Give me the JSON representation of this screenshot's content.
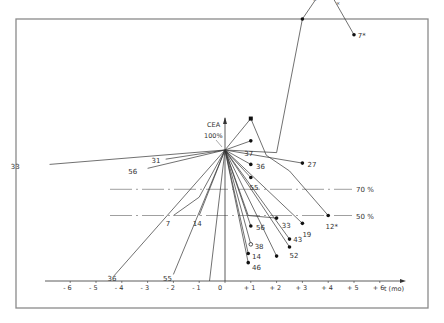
{
  "chart_data": {
    "type": "line",
    "title": "",
    "xlabel": "t (mo)",
    "ylabel": "CEA",
    "reference_label": "100%",
    "xlim": [
      -6.5,
      6.5
    ],
    "ylim": [
      0,
      240
    ],
    "x_ticks": [
      "- 6",
      "- 5",
      "- 4",
      "- 3",
      "- 2",
      "- 1",
      "0",
      "+ 1",
      "+ 2",
      "+ 3",
      "+ 4",
      "+ 5",
      "+ 6"
    ],
    "x_tick_values": [
      -6,
      -5,
      -4,
      -3,
      -2,
      -1,
      0,
      1,
      2,
      3,
      4,
      5,
      6
    ],
    "threshold_lines": [
      {
        "label": "70 %",
        "value": 70
      },
      {
        "label": "50 %",
        "value": 50
      }
    ],
    "peak_annotation": {
      "label": "226 %",
      "x": 3.9,
      "y": 226
    },
    "grid": false,
    "series": [
      {
        "name": "7*",
        "points": [
          [
            0,
            100
          ],
          [
            2.0,
            98
          ],
          [
            3.0,
            200
          ],
          [
            3.9,
            226
          ],
          [
            5.0,
            188
          ]
        ],
        "marker": true,
        "label_end": "7*"
      },
      {
        "name": "unlabeled-peak",
        "points": [
          [
            0,
            100
          ],
          [
            1.0,
            124
          ],
          [
            1.6,
            96
          ],
          [
            2.5,
            84
          ],
          [
            4.0,
            50
          ]
        ],
        "marker": true,
        "label_end": "12*"
      },
      {
        "name": "37",
        "points": [
          [
            0,
            100
          ],
          [
            1.0,
            107
          ]
        ],
        "marker": true
      },
      {
        "name": "27",
        "points": [
          [
            0,
            100
          ],
          [
            3.0,
            90
          ]
        ],
        "marker": true
      },
      {
        "name": "36a",
        "points": [
          [
            0,
            100
          ],
          [
            1.0,
            89
          ]
        ],
        "marker": true
      },
      {
        "name": "55a",
        "points": [
          [
            0,
            100
          ],
          [
            1.0,
            79
          ]
        ],
        "marker": true
      },
      {
        "name": "33b",
        "points": [
          [
            0,
            100
          ],
          [
            0.9,
            50
          ],
          [
            2.0,
            48
          ]
        ],
        "marker": true
      },
      {
        "name": "19",
        "points": [
          [
            0,
            100
          ],
          [
            3.0,
            44
          ]
        ],
        "marker": true
      },
      {
        "name": "43",
        "points": [
          [
            0,
            100
          ],
          [
            2.5,
            32
          ]
        ],
        "marker": true
      },
      {
        "name": "52",
        "points": [
          [
            0,
            100
          ],
          [
            2.5,
            26
          ]
        ],
        "marker": true
      },
      {
        "name": "unlabeled-2",
        "points": [
          [
            0,
            100
          ],
          [
            2.0,
            19
          ]
        ],
        "marker": true
      },
      {
        "name": "56b",
        "points": [
          [
            0,
            100
          ],
          [
            1.0,
            42
          ]
        ],
        "marker": true
      },
      {
        "name": "38",
        "points": [
          [
            0,
            100
          ],
          [
            1.0,
            28
          ]
        ],
        "marker": "open"
      },
      {
        "name": "14b",
        "points": [
          [
            0,
            100
          ],
          [
            0.9,
            21
          ]
        ],
        "marker": true
      },
      {
        "name": "46",
        "points": [
          [
            0,
            100
          ],
          [
            0.9,
            14
          ]
        ],
        "marker": true
      },
      {
        "name": "33",
        "points": [
          [
            -6.8,
            89
          ],
          [
            0,
            100
          ]
        ],
        "label_start": "33"
      },
      {
        "name": "31",
        "points": [
          [
            -2.3,
            93
          ],
          [
            0,
            100
          ]
        ],
        "label_start": "31"
      },
      {
        "name": "56",
        "points": [
          [
            -3.0,
            86
          ],
          [
            0,
            100
          ]
        ],
        "label_start": "56"
      },
      {
        "name": "7",
        "points": [
          [
            -2.0,
            50
          ],
          [
            -1.0,
            64
          ],
          [
            0,
            100
          ]
        ],
        "label_start": "7"
      },
      {
        "name": "14",
        "points": [
          [
            -1.0,
            50
          ],
          [
            0,
            100
          ]
        ],
        "label_start": "14"
      },
      {
        "name": "36",
        "points": [
          [
            -4.3,
            4
          ],
          [
            0,
            100
          ]
        ],
        "label_start": "36"
      },
      {
        "name": "55",
        "points": [
          [
            -2.0,
            5
          ],
          [
            0,
            100
          ]
        ],
        "label_start": "55"
      },
      {
        "name": "unlabeled-3",
        "points": [
          [
            -0.6,
            0
          ],
          [
            0,
            100
          ]
        ]
      }
    ]
  }
}
